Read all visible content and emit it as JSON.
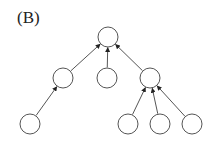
{
  "panel_label": "(B)",
  "diagram": {
    "type": "tree",
    "edge_direction": "child-to-parent",
    "stroke_color": "#555555",
    "node_fill": "#ffffff",
    "node_radius": 10,
    "nodes": [
      {
        "id": "root",
        "cx": 108,
        "cy": 37
      },
      {
        "id": "mid-left",
        "cx": 63,
        "cy": 78
      },
      {
        "id": "mid-center",
        "cx": 107,
        "cy": 78
      },
      {
        "id": "mid-right",
        "cx": 150,
        "cy": 78
      },
      {
        "id": "leaf-left",
        "cx": 30,
        "cy": 124
      },
      {
        "id": "leaf-right-1",
        "cx": 128,
        "cy": 124
      },
      {
        "id": "leaf-right-2",
        "cx": 160,
        "cy": 124
      },
      {
        "id": "leaf-right-3",
        "cx": 192,
        "cy": 124
      }
    ],
    "edges": [
      {
        "from": "mid-left",
        "to": "root"
      },
      {
        "from": "mid-center",
        "to": "root"
      },
      {
        "from": "mid-right",
        "to": "root"
      },
      {
        "from": "leaf-left",
        "to": "mid-left"
      },
      {
        "from": "leaf-right-1",
        "to": "mid-right"
      },
      {
        "from": "leaf-right-2",
        "to": "mid-right"
      },
      {
        "from": "leaf-right-3",
        "to": "mid-right"
      }
    ]
  }
}
